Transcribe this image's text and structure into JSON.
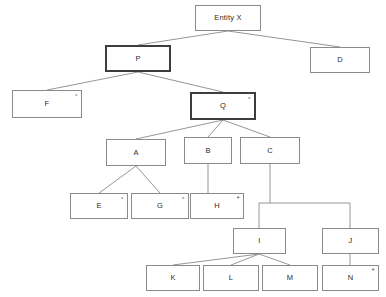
{
  "diagram": {
    "canvas": {
      "width": 386,
      "height": 297
    },
    "style": {
      "background": "#ffffff",
      "line_color": "#8a8a8a",
      "bold_border_color": "#3d3d3d",
      "text_color": "#2b2b2b"
    },
    "markers": {
      "degree": "°",
      "asterisk": "*"
    },
    "nodes": [
      {
        "id": "entity-x",
        "label": "Entity X",
        "marker": "",
        "bold": false,
        "x": 195,
        "y": 5,
        "w": 66,
        "h": 26
      },
      {
        "id": "p",
        "label": "P",
        "marker": "",
        "bold": true,
        "x": 105,
        "y": 45,
        "w": 66,
        "h": 27
      },
      {
        "id": "d",
        "label": "D",
        "marker": "",
        "bold": false,
        "x": 310,
        "y": 47,
        "w": 60,
        "h": 26
      },
      {
        "id": "f",
        "label": "F",
        "marker": "°",
        "bold": false,
        "x": 12,
        "y": 90,
        "w": 70,
        "h": 28
      },
      {
        "id": "q",
        "label": "Q",
        "marker": "°",
        "bold": true,
        "x": 190,
        "y": 92,
        "w": 66,
        "h": 28
      },
      {
        "id": "a",
        "label": "A",
        "marker": "",
        "bold": false,
        "x": 106,
        "y": 139,
        "w": 60,
        "h": 27
      },
      {
        "id": "b",
        "label": "B",
        "marker": "",
        "bold": false,
        "x": 184,
        "y": 137,
        "w": 48,
        "h": 27
      },
      {
        "id": "c",
        "label": "C",
        "marker": "",
        "bold": false,
        "x": 240,
        "y": 137,
        "w": 60,
        "h": 27
      },
      {
        "id": "e",
        "label": "E",
        "marker": "°",
        "bold": false,
        "x": 70,
        "y": 193,
        "w": 58,
        "h": 26
      },
      {
        "id": "g",
        "label": "G",
        "marker": "°",
        "bold": false,
        "x": 131,
        "y": 193,
        "w": 58,
        "h": 26
      },
      {
        "id": "h",
        "label": "H",
        "marker": "*",
        "bold": false,
        "x": 190,
        "y": 193,
        "w": 54,
        "h": 26
      },
      {
        "id": "i",
        "label": "I",
        "marker": "",
        "bold": false,
        "x": 233,
        "y": 228,
        "w": 53,
        "h": 26
      },
      {
        "id": "j",
        "label": "J",
        "marker": "",
        "bold": false,
        "x": 322,
        "y": 228,
        "w": 57,
        "h": 26
      },
      {
        "id": "k",
        "label": "K",
        "marker": "",
        "bold": false,
        "x": 146,
        "y": 265,
        "w": 54,
        "h": 26
      },
      {
        "id": "l",
        "label": "L",
        "marker": "",
        "bold": false,
        "x": 203,
        "y": 265,
        "w": 56,
        "h": 26
      },
      {
        "id": "m",
        "label": "M",
        "marker": "",
        "bold": false,
        "x": 262,
        "y": 265,
        "w": 56,
        "h": 26
      },
      {
        "id": "n",
        "label": "N",
        "marker": "*",
        "bold": false,
        "x": 322,
        "y": 265,
        "w": 57,
        "h": 26
      }
    ],
    "edges": [
      {
        "from": "entity-x",
        "to": "p",
        "type": "diagonal"
      },
      {
        "from": "entity-x",
        "to": "d",
        "type": "diagonal"
      },
      {
        "from": "p",
        "to": "f",
        "type": "diagonal"
      },
      {
        "from": "p",
        "to": "q",
        "type": "diagonal"
      },
      {
        "from": "q",
        "to": "a",
        "type": "diagonal"
      },
      {
        "from": "q",
        "to": "b",
        "type": "diagonal"
      },
      {
        "from": "q",
        "to": "c",
        "type": "diagonal"
      },
      {
        "from": "a",
        "to": "e",
        "type": "diagonal"
      },
      {
        "from": "a",
        "to": "g",
        "type": "diagonal"
      },
      {
        "from": "b",
        "to": "h",
        "type": "vertical"
      },
      {
        "from": "c",
        "to": "i",
        "type": "bus"
      },
      {
        "from": "c",
        "to": "j",
        "type": "bus"
      },
      {
        "from": "i",
        "to": "k",
        "type": "diagonal"
      },
      {
        "from": "i",
        "to": "l",
        "type": "diagonal"
      },
      {
        "from": "i",
        "to": "m",
        "type": "diagonal"
      },
      {
        "from": "j",
        "to": "n",
        "type": "vertical"
      }
    ]
  }
}
